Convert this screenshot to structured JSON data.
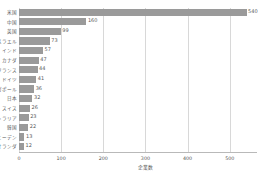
{
  "chart_data": {
    "type": "bar",
    "orientation": "horizontal",
    "title": "",
    "subtitle": "",
    "xlabel": "企業数",
    "ylabel": "",
    "xlim": [
      0,
      560
    ],
    "ylim": null,
    "grid": "vertical",
    "legend": null,
    "legend_position": "none",
    "bar_color": "#9a9a9a",
    "gridline_color": "#d8d8d8",
    "axis_color": "#b9b9b9",
    "background_color": "#ffffff",
    "xticks": [
      0,
      100,
      200,
      300,
      400,
      500
    ],
    "xticklabels": [
      "0",
      "100",
      "200",
      "300",
      "400",
      "500"
    ],
    "categories": [
      "米国",
      "中国",
      "英国",
      "イスラエル",
      "インド",
      "カナダ",
      "フランス",
      "ドイツ",
      "シンガポール",
      "日本",
      "スイス",
      "オーストラリア",
      "韓国",
      "スウェーデン",
      "オランダ"
    ],
    "values": [
      540,
      160,
      99,
      73,
      57,
      47,
      44,
      41,
      36,
      32,
      26,
      23,
      22,
      13,
      12
    ],
    "value_labels": [
      "540",
      "160",
      "99",
      "73",
      "57",
      "47",
      "44",
      "41",
      "36",
      "32",
      "26",
      "23",
      "22",
      "13",
      "12"
    ]
  }
}
